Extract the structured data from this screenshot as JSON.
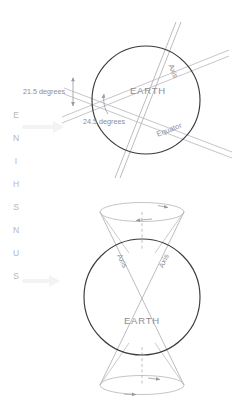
{
  "figure": {
    "title_text_vertical": "SUNSHINE",
    "vertical_letters": [
      "E",
      "N",
      "I",
      "H",
      "S",
      "N",
      "U",
      "S"
    ],
    "colors": {
      "circle_stroke": "#3b3b3b",
      "line_gray": "#a9a9ae",
      "line_light": "#c3c3c8",
      "text_gray": "#8d8d92",
      "text_faint": "#c9c9ce",
      "background": "#ffffff"
    }
  },
  "top_diagram": {
    "name": "earth-axial-tilt-diagram",
    "body_label": "EARTH",
    "axis_label": "Axis",
    "equator_label": "Equator",
    "angle_labels": [
      {
        "value": "21.5 degrees"
      },
      {
        "value": "24.5 degrees"
      }
    ],
    "geometry": {
      "center_x": 146,
      "center_y": 100,
      "radius": 54,
      "axis_tilt_degrees": 24.5,
      "equator_tilt_degrees": 21.5
    }
  },
  "bottom_diagram": {
    "name": "earth-axial-precession-diagram",
    "body_label": "EARTH",
    "axis_label_left": "Axis",
    "axis_label_right": "Axis",
    "geometry": {
      "center_x": 142,
      "center_y": 297,
      "radius": 58,
      "cone_half_angle_degrees": 23
    }
  },
  "sunshine_arrows": [
    {
      "name": "sunshine-arrow-upper"
    },
    {
      "name": "sunshine-arrow-lower"
    }
  ]
}
